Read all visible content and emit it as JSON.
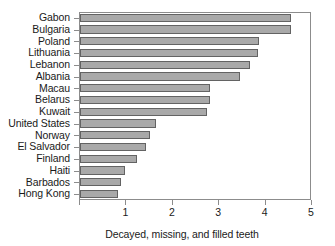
{
  "chart_data": {
    "type": "bar",
    "orientation": "horizontal",
    "title": "",
    "xlabel": "Decayed, missing, and filled teeth",
    "ylabel": "",
    "xlim": [
      0,
      5
    ],
    "x_ticks": [
      1,
      2,
      3,
      4,
      5
    ],
    "x_tick_labels": [
      "1",
      "2",
      "3",
      "4",
      "5"
    ],
    "grid": false,
    "legend": null,
    "bar_color": "#a9a9a9",
    "bar_edge_color": "#636363",
    "frame_color": "#8c8c8c",
    "categories": [
      "Gabon",
      "Bulgaria",
      "Poland",
      "Lithuania",
      "Lebanon",
      "Albania",
      "Macau",
      "Belarus",
      "Kuwait",
      "United States",
      "Norway",
      "El Salvador",
      "Finland",
      "Haiti",
      "Barbados",
      "Hong Kong"
    ],
    "values": [
      4.57,
      4.57,
      3.88,
      3.85,
      3.68,
      3.46,
      2.82,
      2.82,
      2.75,
      1.66,
      1.53,
      1.44,
      1.25,
      1.0,
      0.9,
      0.85
    ]
  }
}
